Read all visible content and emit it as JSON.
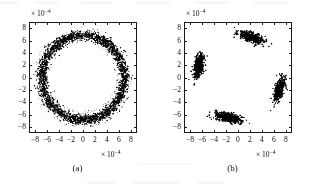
{
  "figure": {
    "panel_count": 2,
    "axis_multiplier_text": "× 10",
    "axis_multiplier_exponent": "−4"
  },
  "panels": [
    {
      "caption": "(a)",
      "xlabel_multiplier": "× 10",
      "ylabel_multiplier": "× 10",
      "exponent": "−4",
      "xticks": [
        "−8",
        "−6",
        "−4",
        "−2",
        "0",
        "2",
        "4",
        "6",
        "8"
      ],
      "yticks": [
        "8",
        "6",
        "4",
        "2",
        "0",
        "−2",
        "−4",
        "−6",
        "−8"
      ]
    },
    {
      "caption": "(b)",
      "xlabel_multiplier": "× 10",
      "ylabel_multiplier": "× 10",
      "exponent": "−4",
      "xticks": [
        "−8",
        "−6",
        "−4",
        "−2",
        "0",
        "2",
        "4",
        "6",
        "8"
      ],
      "yticks": [
        "8",
        "6",
        "4",
        "2",
        "0",
        "−2",
        "−4",
        "−6",
        "−8"
      ]
    }
  ],
  "chart_data": [
    {
      "type": "scatter",
      "title": "(a)",
      "xlabel": "× 10−4",
      "ylabel": "× 10−4",
      "xlim": [
        -9,
        9
      ],
      "ylim": [
        -9,
        9
      ],
      "xticks": [
        -8,
        -6,
        -4,
        -2,
        0,
        2,
        4,
        6,
        8
      ],
      "yticks": [
        -8,
        -6,
        -4,
        -2,
        0,
        2,
        4,
        6,
        8
      ],
      "grid": false,
      "legend": null,
      "marker": "dot",
      "marker_color": "#000000",
      "description": "Dense noisy annulus (ring) of constellation samples centred at the origin",
      "series": [
        {
          "name": "ring-cloud",
          "shape": "annulus",
          "center": [
            0,
            0
          ],
          "radius_mean": 7.0,
          "radius_sigma": 0.42,
          "n_points": 3000
        }
      ]
    },
    {
      "type": "scatter",
      "title": "(b)",
      "xlabel": "× 10−4",
      "ylabel": "× 10−4",
      "xlim": [
        -9,
        9
      ],
      "ylim": [
        -9,
        9
      ],
      "xticks": [
        -8,
        -6,
        -4,
        -2,
        0,
        2,
        4,
        6,
        8
      ],
      "yticks": [
        -8,
        -6,
        -4,
        -2,
        0,
        2,
        4,
        6,
        8
      ],
      "grid": false,
      "legend": null,
      "marker": "dot",
      "marker_color": "#000000",
      "description": "Four tilted elliptical constellation clusters (QPSK-like), rotated about 20 degrees",
      "series": [
        {
          "name": "cluster-1",
          "center": [
            2.3,
            6.6
          ],
          "sigma_major": 1.15,
          "sigma_minor": 0.38,
          "angle_deg": -18,
          "n_points": 420
        },
        {
          "name": "cluster-2",
          "center": [
            -6.7,
            1.8
          ],
          "sigma_major": 1.05,
          "sigma_minor": 0.4,
          "angle_deg": 78,
          "n_points": 420
        },
        {
          "name": "cluster-3",
          "center": [
            7.0,
            -2.0
          ],
          "sigma_major": 1.05,
          "sigma_minor": 0.38,
          "angle_deg": 72,
          "n_points": 420
        },
        {
          "name": "cluster-4",
          "center": [
            -1.7,
            -6.6
          ],
          "sigma_major": 1.15,
          "sigma_minor": 0.38,
          "angle_deg": -12,
          "n_points": 420
        }
      ]
    }
  ]
}
